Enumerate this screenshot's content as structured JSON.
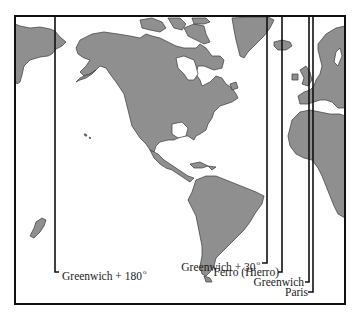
{
  "map": {
    "type": "world map (Americas and western Europe/Africa) with prime meridian lines",
    "land_color": "#8f8f8f",
    "coast_color": "#3a3a3a",
    "frame_color": "#111111",
    "meridians": [
      {
        "id": "greenwich-180",
        "label": "Greenwich + 180",
        "degree": "o"
      },
      {
        "id": "greenwich-30",
        "label": "Greenwich + 30",
        "degree": "o"
      },
      {
        "id": "ferro",
        "label": "Ferro (Hierro)"
      },
      {
        "id": "greenwich",
        "label": "Greenwich"
      },
      {
        "id": "paris",
        "label": "Paris"
      }
    ]
  }
}
